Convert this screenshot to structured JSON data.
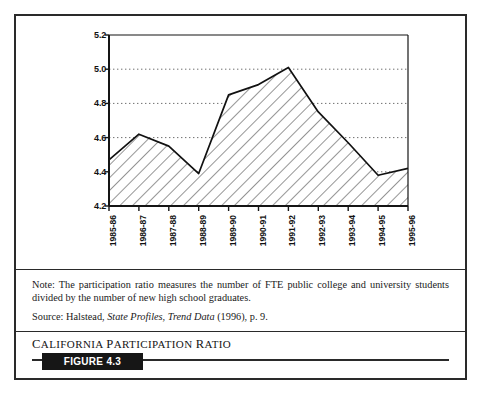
{
  "figure": {
    "caption_title": "California Participation Ratio",
    "badge_label": "FIGURE 4.3"
  },
  "note": {
    "line1": "Note: The participation ratio measures the number of FTE public college and university students divided by the number of new high school graduates.",
    "source_prefix": "Source: Halstead, ",
    "source_italic1": "State Profiles",
    "source_mid": ", ",
    "source_italic2": "Trend Data",
    "source_suffix": " (1996), p. 9."
  },
  "chart_data": {
    "type": "area",
    "title": "California Participation Ratio",
    "xlabel": "",
    "ylabel": "",
    "categories": [
      "1985-86",
      "1986-87",
      "1987-88",
      "1988-89",
      "1989-90",
      "1990-91",
      "1991-92",
      "1992-93",
      "1993-94",
      "1994-95",
      "1995-96"
    ],
    "values": [
      4.47,
      4.62,
      4.55,
      4.39,
      4.85,
      4.91,
      5.01,
      4.75,
      4.57,
      4.38,
      4.42
    ],
    "series": [
      {
        "name": "Participation ratio",
        "values": [
          4.47,
          4.62,
          4.55,
          4.39,
          4.85,
          4.91,
          5.01,
          4.75,
          4.57,
          4.38,
          4.42
        ]
      }
    ],
    "ylim": [
      4.2,
      5.2
    ],
    "yticks": [
      4.2,
      4.4,
      4.6,
      4.8,
      5.0,
      5.2
    ],
    "ytick_labels": [
      "4.2",
      "4.4",
      "4.6",
      "4.8",
      "5.0",
      "5.2"
    ],
    "grid": "horizontal-dotted",
    "gridline_values": [
      4.4,
      4.6,
      4.8,
      5.0
    ],
    "legend": "none",
    "fill": "diagonal-hatch",
    "line_color": "#111111",
    "fill_color": "#ffffff",
    "hatch_color": "#3a3a3a",
    "background": "#ffffff"
  }
}
